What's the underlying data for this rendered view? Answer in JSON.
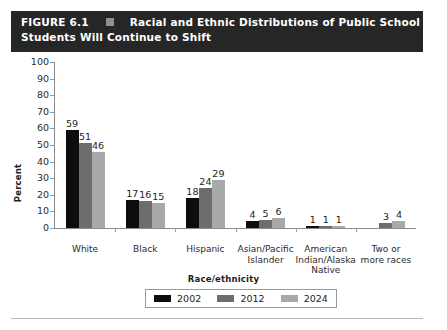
{
  "title": {
    "figure_number": "FIGURE 6.1",
    "marker_icon": "square-marker",
    "line1": "Racial and Ethnic Distributions of Public School",
    "line2": "Students Will Continue to Shift"
  },
  "chart_data": {
    "type": "bar",
    "title": "Racial and Ethnic Distributions of Public School Students Will Continue to Shift",
    "xlabel": "Race/ethnicity",
    "ylabel": "Percent",
    "ylim": [
      0,
      100
    ],
    "ytick_step": 10,
    "ytick_labels": [
      "100",
      "90",
      "80",
      "70",
      "60",
      "50",
      "40",
      "30",
      "20",
      "10",
      "0"
    ],
    "grid": false,
    "legend_position": "bottom",
    "categories": [
      "White",
      "Black",
      "Hispanic",
      "Asian/Pacific Islander",
      "American Indian/Alaska Native",
      "Two or more races"
    ],
    "category_lines": [
      [
        "White"
      ],
      [
        "Black"
      ],
      [
        "Hispanic"
      ],
      [
        "Asian/Pacific",
        "Islander"
      ],
      [
        "American",
        "Indian/Alaska",
        "Native"
      ],
      [
        "Two or",
        "more races"
      ]
    ],
    "series": [
      {
        "name": "2002",
        "color": "#0d0d0d",
        "values": [
          59,
          17,
          18,
          4,
          1,
          null
        ]
      },
      {
        "name": "2012",
        "color": "#6d6d6d",
        "values": [
          51,
          16,
          24,
          5,
          1,
          3
        ]
      },
      {
        "name": "2024",
        "color": "#a9a9a9",
        "values": [
          46,
          15,
          29,
          6,
          1,
          4
        ]
      }
    ],
    "value_labels": [
      [
        "59",
        "51",
        "46"
      ],
      [
        "17",
        "16",
        "15"
      ],
      [
        "18",
        "24",
        "29"
      ],
      [
        "4",
        "5",
        "6"
      ],
      [
        "1",
        "1",
        "1"
      ],
      [
        "",
        "3",
        "4"
      ]
    ]
  },
  "legend": {
    "items": [
      {
        "label": "2002",
        "color": "#0d0d0d"
      },
      {
        "label": "2012",
        "color": "#6d6d6d"
      },
      {
        "label": "2024",
        "color": "#a9a9a9"
      }
    ]
  },
  "colors": {
    "title_bar_bg": "#262626",
    "title_text": "#ffffff",
    "axis": "#8a8a8a",
    "text": "#1d1d1d"
  }
}
